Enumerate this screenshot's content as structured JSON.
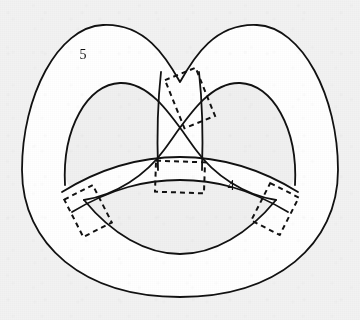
{
  "figure": {
    "type": "knot-surface-diagram",
    "canvas": {
      "width": 360,
      "height": 320
    },
    "background_color": "#f2f2f2",
    "stroke_color": "#111111",
    "surface_fill_color": "#ffffff",
    "hole_fill_color": "#f0f0f0",
    "stroke_width": 1.8,
    "dashed_stroke_width": 2.0,
    "dash_pattern": "5 4"
  },
  "labels": [
    {
      "id": "label-5",
      "text": "5",
      "x": 83,
      "y": 59,
      "describes": "outer pretzel band"
    },
    {
      "id": "label-4",
      "text": "4",
      "x": 231,
      "y": 190,
      "describes": "lower horizontal band"
    }
  ],
  "dashed_markers": [
    {
      "id": "marker-top-crossing",
      "name": "dashed-rect-top-crossing",
      "center_x": 190,
      "center_y": 98,
      "width": 33,
      "height": 52,
      "rotation_deg": -22,
      "note": "upper right crossing of left lobe strand over right lobe strand"
    },
    {
      "id": "marker-center-band",
      "name": "dashed-rect-center-band",
      "center_x": 180,
      "center_y": 177,
      "width": 49,
      "height": 31,
      "rotation_deg": 2,
      "note": "center attachment of the two vertical strands to band 4"
    },
    {
      "id": "marker-left-band",
      "name": "dashed-rect-left-band",
      "center_x": 88,
      "center_y": 211,
      "width": 32,
      "height": 42,
      "rotation_deg": -27,
      "note": "left end crossing of band 4 under outer band 5"
    },
    {
      "id": "marker-right-band",
      "name": "dashed-rect-right-band",
      "center_x": 275,
      "center_y": 209,
      "width": 32,
      "height": 42,
      "rotation_deg": 27,
      "note": "right end crossing of band 4 under outer band 5"
    }
  ],
  "geometry": {
    "outer_boundary": "M 22,170 C 22,92 60,28 103,26 C 143,24 165,58 180,82 C 195,58 217,24 257,26 C 300,28 338,92 338,170 C 338,243 277,297 180,297 C 83,297 22,243 22,170 Z",
    "inner_left_hole": "M 66,171 C 66,121 88,86 119,84 C 150,82 170,116 180,140 L 180,178 C 150,178 110,196 90,214 C 74,203 66,188 66,171 Z",
    "inner_right_hole": "M 294,171 C 294,121 272,86 241,84 C 210,82 190,116 180,140 L 180,178 C 210,178 250,196 270,214 C 286,203 294,188 294,171 Z",
    "lower_hole": "M 90,214 C 120,242 150,254 180,254 C 210,254 240,242 270,214 C 240,196 210,186 180,186 C 150,186 120,196 90,214 Z",
    "band_top_edge": "M 70,196 C 110,172 145,164 180,164 C 215,164 250,172 290,196",
    "band_bottom_edge": "M 84,216 C 120,194 150,186 180,186 C 210,186 240,194 276,216",
    "vertical_strand_left": "M 160,72 C 158,108 158,140 159,178",
    "vertical_strand_right": "M 200,72 C 202,108 202,140 201,178"
  },
  "extents": {
    "left_x": 22,
    "right_x": 338,
    "top_y": 25,
    "bottom_y": 297
  }
}
